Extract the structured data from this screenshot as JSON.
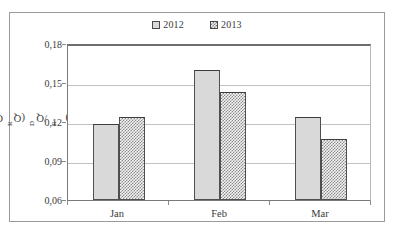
{
  "chart_data": {
    "type": "bar",
    "title": "",
    "subtitle": "",
    "xlabel": "",
    "ylabel": "CV_R(Q_D/Q_R)",
    "ylabel_parts": {
      "main1": "CV",
      "sub1": "R",
      "open": "(Q",
      "sub2": "D",
      "slash": "/Q",
      "sub3": "R",
      "close": ")"
    },
    "categories": [
      "Jan",
      "Feb",
      "Mar"
    ],
    "series": [
      {
        "name": "2012",
        "values": [
          0.1195,
          0.161,
          0.125
        ],
        "fill": "solid-gray",
        "color": "#d9d9d9"
      },
      {
        "name": "2013",
        "values": [
          0.125,
          0.144,
          0.1075
        ],
        "fill": "dotted",
        "color": "#f4f4f4"
      }
    ],
    "ylim": [
      0.06,
      0.18
    ],
    "yticks": [
      0.18,
      0.15,
      0.12,
      0.09,
      0.06
    ],
    "ytick_labels": [
      "0,18",
      "0,15",
      "0,12",
      "0,09",
      "0,06"
    ],
    "decimal_separator": ",",
    "grid": true,
    "grid_axis": "y",
    "legend_position": "top-center",
    "border": true
  },
  "legend": {
    "entries": [
      {
        "label": "2012",
        "swatch": "solid-gray-square"
      },
      {
        "label": "2013",
        "swatch": "dotted-square"
      }
    ]
  }
}
